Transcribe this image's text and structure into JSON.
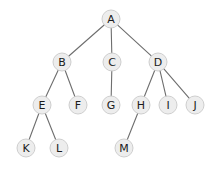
{
  "diagram": {
    "type": "tree",
    "background_color": "#ffffff",
    "node_fill_color": "#ededed",
    "node_stroke_color": "#c9c9c9",
    "edge_color": "#6e6e6e",
    "label_color": "#1a1a1a",
    "node_radius": 9,
    "nodes": [
      {
        "id": "A",
        "label": "A",
        "x": 111,
        "y": 19,
        "level": 0
      },
      {
        "id": "B",
        "label": "B",
        "x": 62,
        "y": 62,
        "level": 1
      },
      {
        "id": "C",
        "label": "C",
        "x": 112,
        "y": 62,
        "level": 1
      },
      {
        "id": "D",
        "label": "D",
        "x": 158,
        "y": 62,
        "level": 1
      },
      {
        "id": "E",
        "label": "E",
        "x": 42,
        "y": 105,
        "level": 2
      },
      {
        "id": "F",
        "label": "F",
        "x": 78,
        "y": 105,
        "level": 2
      },
      {
        "id": "G",
        "label": "G",
        "x": 111,
        "y": 105,
        "level": 2
      },
      {
        "id": "H",
        "label": "H",
        "x": 141,
        "y": 105,
        "level": 2
      },
      {
        "id": "I",
        "label": "I",
        "x": 168,
        "y": 105,
        "level": 2
      },
      {
        "id": "J",
        "label": "J",
        "x": 195,
        "y": 105,
        "level": 2
      },
      {
        "id": "K",
        "label": "K",
        "x": 26,
        "y": 148,
        "level": 3
      },
      {
        "id": "L",
        "label": "L",
        "x": 59,
        "y": 148,
        "level": 3
      },
      {
        "id": "M",
        "label": "M",
        "x": 124,
        "y": 148,
        "level": 3
      }
    ],
    "edges": [
      {
        "from": "A",
        "to": "B"
      },
      {
        "from": "A",
        "to": "C"
      },
      {
        "from": "A",
        "to": "D"
      },
      {
        "from": "B",
        "to": "E"
      },
      {
        "from": "B",
        "to": "F"
      },
      {
        "from": "C",
        "to": "G"
      },
      {
        "from": "D",
        "to": "H"
      },
      {
        "from": "D",
        "to": "I"
      },
      {
        "from": "D",
        "to": "J"
      },
      {
        "from": "E",
        "to": "K"
      },
      {
        "from": "E",
        "to": "L"
      },
      {
        "from": "H",
        "to": "M"
      }
    ]
  }
}
